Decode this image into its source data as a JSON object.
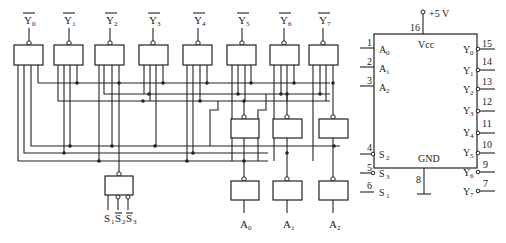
{
  "diagram": {
    "outputs": [
      {
        "name": "Y",
        "sub": "0",
        "overline": true
      },
      {
        "name": "Y",
        "sub": "1",
        "overline": true
      },
      {
        "name": "Y",
        "sub": "2",
        "overline": true
      },
      {
        "name": "Y",
        "sub": "3",
        "overline": true
      },
      {
        "name": "Y",
        "sub": "4",
        "overline": true
      },
      {
        "name": "Y",
        "sub": "5",
        "overline": true
      },
      {
        "name": "Y",
        "sub": "6",
        "overline": true
      },
      {
        "name": "Y",
        "sub": "7",
        "overline": true
      }
    ],
    "address_inputs": [
      {
        "name": "A",
        "sub": "0"
      },
      {
        "name": "A",
        "sub": "1"
      },
      {
        "name": "A",
        "sub": "2"
      }
    ],
    "enable_inputs": [
      {
        "name": "S",
        "sub": "1",
        "overline": false
      },
      {
        "name": "S",
        "sub": "2",
        "overline": true
      },
      {
        "name": "S",
        "sub": "3",
        "overline": true
      }
    ]
  },
  "chip": {
    "supply_label": "+5 V",
    "vcc_label": "Vcc",
    "gnd_label": "GND",
    "vcc_pin": "16",
    "gnd_pin": "8",
    "left_pins": [
      {
        "num": "1",
        "name": "A",
        "sub": "0",
        "inverted": false
      },
      {
        "num": "2",
        "name": "A",
        "sub": "1",
        "inverted": false
      },
      {
        "num": "3",
        "name": "A",
        "sub": "2",
        "inverted": false
      },
      {
        "num": "4",
        "name": "S",
        "sub": "2",
        "inverted": true
      },
      {
        "num": "5",
        "name": "S",
        "sub": "3",
        "inverted": true
      },
      {
        "num": "6",
        "name": "S",
        "sub": "1",
        "inverted": false
      }
    ],
    "right_pins": [
      {
        "num": "15",
        "name": "Y",
        "sub": "0"
      },
      {
        "num": "14",
        "name": "Y",
        "sub": "1"
      },
      {
        "num": "13",
        "name": "Y",
        "sub": "2"
      },
      {
        "num": "12",
        "name": "Y",
        "sub": "3"
      },
      {
        "num": "11",
        "name": "Y",
        "sub": "4"
      },
      {
        "num": "10",
        "name": "Y",
        "sub": "5"
      },
      {
        "num": "9",
        "name": "Y",
        "sub": "6"
      },
      {
        "num": "7",
        "name": "Y",
        "sub": "7"
      }
    ]
  }
}
